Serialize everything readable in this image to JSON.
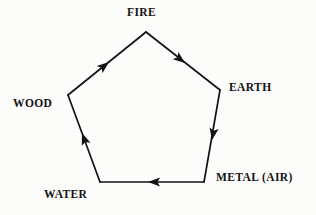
{
  "diagram": {
    "type": "pentagon-cycle",
    "background_color": "#fcfcfb",
    "line_color": "#131313",
    "text_color": "#131313",
    "nodes": [
      {
        "id": "fire",
        "label": "FIRE",
        "vertex": {
          "x": 146,
          "y": 32
        }
      },
      {
        "id": "earth",
        "label": "EARTH",
        "vertex": {
          "x": 220,
          "y": 90
        }
      },
      {
        "id": "metal",
        "label": "METAL (AIR)",
        "vertex": {
          "x": 204,
          "y": 182
        }
      },
      {
        "id": "water",
        "label": "WATER",
        "vertex": {
          "x": 100,
          "y": 182
        }
      },
      {
        "id": "wood",
        "label": "WOOD",
        "vertex": {
          "x": 68,
          "y": 95
        }
      }
    ],
    "edges": [
      {
        "from": "wood",
        "to": "fire",
        "direction": "up-right",
        "arrow_at": {
          "x": 107,
          "y": 63
        }
      },
      {
        "from": "fire",
        "to": "earth",
        "direction": "down-right",
        "arrow_at": {
          "x": 183,
          "y": 61
        }
      },
      {
        "from": "earth",
        "to": "metal",
        "direction": "down",
        "arrow_at": {
          "x": 213,
          "y": 137
        }
      },
      {
        "from": "metal",
        "to": "water",
        "direction": "left",
        "arrow_at": {
          "x": 152,
          "y": 182
        }
      },
      {
        "from": "water",
        "to": "wood",
        "direction": "up",
        "arrow_at": {
          "x": 84,
          "y": 138
        }
      }
    ]
  }
}
